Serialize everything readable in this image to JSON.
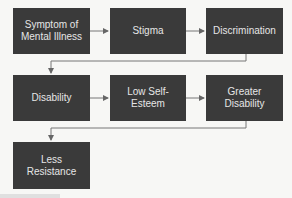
{
  "diagram": {
    "type": "flowchart",
    "colors": {
      "box": "#3a3a3a",
      "text": "#e6e6e6",
      "arrow": "#666666",
      "background": "#f7f7f5"
    },
    "nodes": [
      {
        "id": "symptom",
        "label": "Symptom of\nMental Illness"
      },
      {
        "id": "stigma",
        "label": "Stigma"
      },
      {
        "id": "discrimination",
        "label": "Discrimination"
      },
      {
        "id": "disability",
        "label": "Disability"
      },
      {
        "id": "low_self_esteem",
        "label": "Low Self-\nEsteem"
      },
      {
        "id": "greater_disability",
        "label": "Greater\nDisability"
      },
      {
        "id": "less_resistance",
        "label": "Less\nResistance"
      }
    ],
    "edges": [
      {
        "from": "symptom",
        "to": "stigma"
      },
      {
        "from": "stigma",
        "to": "discrimination"
      },
      {
        "from": "discrimination",
        "to": "disability"
      },
      {
        "from": "disability",
        "to": "low_self_esteem"
      },
      {
        "from": "low_self_esteem",
        "to": "greater_disability"
      },
      {
        "from": "greater_disability",
        "to": "less_resistance"
      }
    ]
  }
}
